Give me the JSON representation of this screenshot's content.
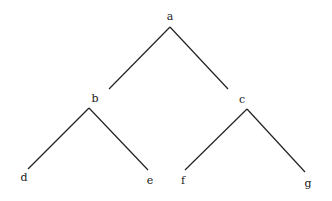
{
  "diagram": {
    "type": "binary-tree",
    "nodes": [
      {
        "id": "a",
        "label": "a",
        "x": 170,
        "y": 16
      },
      {
        "id": "b",
        "label": "b",
        "x": 95,
        "y": 98
      },
      {
        "id": "c",
        "label": "c",
        "x": 242,
        "y": 99
      },
      {
        "id": "d",
        "label": "d",
        "x": 24,
        "y": 177
      },
      {
        "id": "e",
        "label": "e",
        "x": 150,
        "y": 180
      },
      {
        "id": "f",
        "label": "f",
        "x": 183,
        "y": 180
      },
      {
        "id": "g",
        "label": "g",
        "x": 308,
        "y": 183
      }
    ],
    "edges": [
      {
        "from": "a",
        "to": "b",
        "x1": 170,
        "y1": 27,
        "x2": 109,
        "y2": 89
      },
      {
        "from": "a",
        "to": "c",
        "x1": 170,
        "y1": 27,
        "x2": 228,
        "y2": 89
      },
      {
        "from": "b",
        "to": "d",
        "x1": 89,
        "y1": 108,
        "x2": 28,
        "y2": 169
      },
      {
        "from": "b",
        "to": "e",
        "x1": 89,
        "y1": 108,
        "x2": 148,
        "y2": 170
      },
      {
        "from": "c",
        "to": "f",
        "x1": 247,
        "y1": 109,
        "x2": 185,
        "y2": 170
      },
      {
        "from": "c",
        "to": "g",
        "x1": 247,
        "y1": 109,
        "x2": 305,
        "y2": 172
      }
    ],
    "line_color": "#222222"
  }
}
